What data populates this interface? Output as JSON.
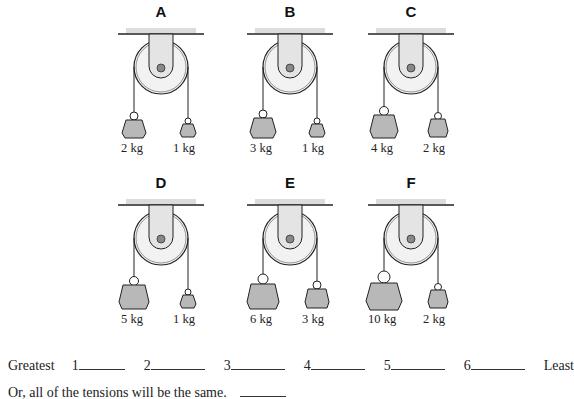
{
  "diagram": {
    "type": "pulley-tension-ranking",
    "colors": {
      "mass_fill": "#b8b8b8",
      "bracket_fill": "#e4e4e4",
      "ceiling_shade": "#dcdcdc",
      "line": "#222222",
      "axle": "#888888"
    },
    "panels": [
      {
        "label": "A",
        "left_mass": "2 kg",
        "right_mass": "1 kg",
        "left_size": 2,
        "right_size": 1
      },
      {
        "label": "B",
        "left_mass": "3 kg",
        "right_mass": "1 kg",
        "left_size": 3,
        "right_size": 1
      },
      {
        "label": "C",
        "left_mass": "4 kg",
        "right_mass": "2 kg",
        "left_size": 4,
        "right_size": 2
      },
      {
        "label": "D",
        "left_mass": "5 kg",
        "right_mass": "1 kg",
        "left_size": 5,
        "right_size": 1
      },
      {
        "label": "E",
        "left_mass": "6 kg",
        "right_mass": "3 kg",
        "left_size": 6,
        "right_size": 3
      },
      {
        "label": "F",
        "left_mass": "10 kg",
        "right_mass": "2 kg",
        "left_size": 10,
        "right_size": 2
      }
    ]
  },
  "ranking": {
    "start_label": "Greatest",
    "slots": [
      "1",
      "2",
      "3",
      "4",
      "5",
      "6"
    ],
    "end_label": "Least"
  },
  "same_option": {
    "text": "Or, all of the tensions will be the same."
  }
}
